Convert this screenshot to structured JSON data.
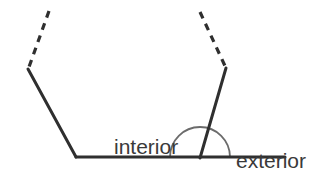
{
  "figure": {
    "kind": "geometry-diagram",
    "background_color": "#ffffff",
    "width": 335,
    "height": 177,
    "stroke_color": "#2f2f2f",
    "arc_color": "#6b6b6b",
    "text_color": "#3a3a3a"
  },
  "labels": {
    "interior": {
      "line1": "interior",
      "line2": "angle"
    },
    "exterior": {
      "line1": "exterior",
      "line2": "angle"
    }
  },
  "geometry": {
    "baseline": {
      "x1": 76,
      "y1": 157,
      "x2": 285,
      "y2": 157
    },
    "left_side": {
      "x1": 28,
      "y1": 69,
      "x2": 76,
      "y2": 157
    },
    "left_dashed": {
      "x1": 49,
      "y1": 11,
      "x2": 29,
      "y2": 67,
      "dash": "7 6"
    },
    "right_side": {
      "x1": 226,
      "y1": 68,
      "x2": 200,
      "y2": 158
    },
    "right_dashed": {
      "x1": 200,
      "y1": 12,
      "x2": 225,
      "y2": 66,
      "dash": "7 6"
    },
    "angle_arc": {
      "center_x": 200,
      "center_y": 157,
      "radius": 30,
      "start_x": 170,
      "start_y": 157,
      "end_x": 230,
      "end_y": 157
    }
  }
}
